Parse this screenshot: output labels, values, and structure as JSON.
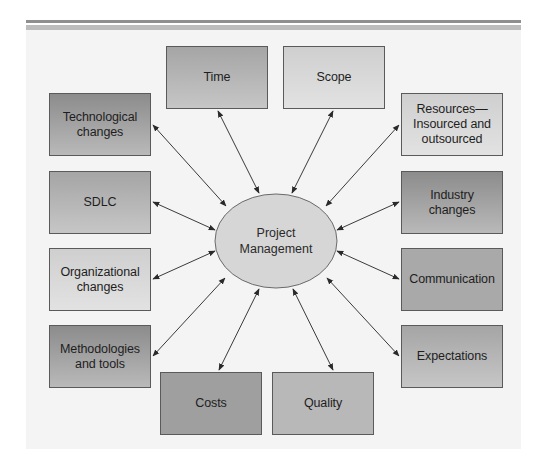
{
  "diagram": {
    "type": "hub-and-spoke",
    "center": {
      "label_line1": "Project",
      "label_line2": "Management",
      "fill": "#d6d6d6"
    },
    "nodes": {
      "time": {
        "label": "Time",
        "position": "top"
      },
      "scope": {
        "label": "Scope",
        "position": "top"
      },
      "technological_changes": {
        "label_line1": "Technological",
        "label_line2": "changes",
        "position": "left"
      },
      "sdlc": {
        "label": "SDLC",
        "position": "left"
      },
      "organizational_changes": {
        "label_line1": "Organizational",
        "label_line2": "changes",
        "position": "left"
      },
      "methodologies_tools": {
        "label_line1": "Methodologies",
        "label_line2": "and tools",
        "position": "left"
      },
      "resources": {
        "label_line1": "Resources—",
        "label_line2": "Insourced and",
        "label_line3": "outsourced",
        "position": "right"
      },
      "industry_changes": {
        "label_line1": "Industry",
        "label_line2": "changes",
        "position": "right"
      },
      "communication": {
        "label": "Communication",
        "position": "right"
      },
      "expectations": {
        "label": "Expectations",
        "position": "right"
      },
      "costs": {
        "label": "Costs",
        "position": "bottom"
      },
      "quality": {
        "label": "Quality",
        "position": "bottom"
      }
    },
    "edges_bidirectional": [
      [
        "Project Management",
        "Time"
      ],
      [
        "Project Management",
        "Scope"
      ],
      [
        "Project Management",
        "Technological changes"
      ],
      [
        "Project Management",
        "SDLC"
      ],
      [
        "Project Management",
        "Organizational changes"
      ],
      [
        "Project Management",
        "Methodologies and tools"
      ],
      [
        "Project Management",
        "Resources—Insourced and outsourced"
      ],
      [
        "Project Management",
        "Industry changes"
      ],
      [
        "Project Management",
        "Communication"
      ],
      [
        "Project Management",
        "Expectations"
      ],
      [
        "Project Management",
        "Costs"
      ],
      [
        "Project Management",
        "Quality"
      ]
    ],
    "colors": {
      "panel": "#f4f4f4",
      "border": "#5a5a5a",
      "arrow": "#333333",
      "rule_dark": "#8f8f8f",
      "rule_light": "#bcbcbc"
    }
  }
}
